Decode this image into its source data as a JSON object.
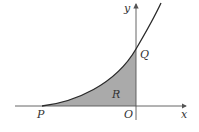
{
  "diagram": {
    "labels": {
      "y_axis": "y",
      "x_axis": "x",
      "origin": "O",
      "point_p": "P",
      "point_q": "Q",
      "region": "R"
    },
    "colors": {
      "curve": "#2a2a2a",
      "axis": "#555555",
      "shade": "#aaaaaa",
      "text": "#333333"
    }
  }
}
